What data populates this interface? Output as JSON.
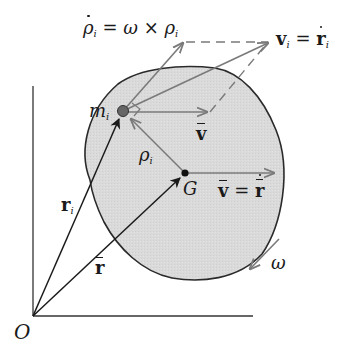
{
  "diagram": {
    "type": "rigid-body-kinematics",
    "labels": {
      "rho_dot": {
        "base": "ρ",
        "sub": "i",
        "rest": " = ω × ρ",
        "rest_sub": "i"
      },
      "v_i": {
        "base": "v",
        "sub": "i",
        "eq": " = ",
        "rhs": "r",
        "rhs_sub": "i"
      },
      "m_i": {
        "base": "m",
        "sub": "i"
      },
      "v_bar_upper": "v",
      "rho_i": {
        "base": "ρ",
        "sub": "i"
      },
      "G": "G",
      "v_bar_eq": {
        "lhs": "v",
        "eq": " = ",
        "rhs": "r"
      },
      "r_i": {
        "base": "r",
        "sub": "i"
      },
      "r_bar": "r",
      "omega": "ω",
      "origin": "O"
    },
    "colors": {
      "body_fill": "#d9d9d9",
      "body_outline": "#2a2a2a",
      "vector_black": "#1a1a1a",
      "vector_gray": "#7a7a7a",
      "axis": "#333333"
    }
  }
}
